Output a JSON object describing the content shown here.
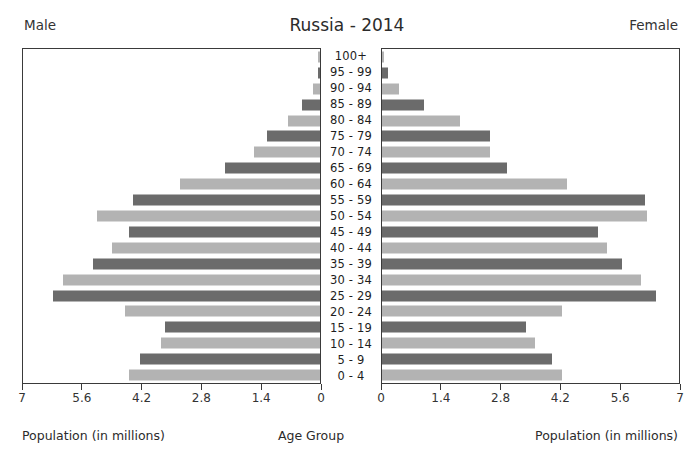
{
  "header": {
    "title": "Russia - 2014",
    "male_label": "Male",
    "female_label": "Female"
  },
  "footer": {
    "left_caption": "Population (in millions)",
    "center_caption": "Age Group",
    "right_caption": "Population (in millions)"
  },
  "axis": {
    "male_ticks": [
      "7",
      "5.6",
      "4.2",
      "2.8",
      "1.4",
      "0"
    ],
    "female_ticks": [
      "0",
      "1.4",
      "2.8",
      "4.2",
      "5.6",
      "7"
    ],
    "max": 7,
    "tick_step": 1.4
  },
  "style": {
    "bar_dark": "#6b6b6b",
    "bar_light": "#b3b3b3",
    "frame": "#3a3a3a",
    "background": "#ffffff",
    "text": "#2b2b2b"
  },
  "chart_data": {
    "type": "bar",
    "title": "Russia - 2014",
    "subtitle": "",
    "xlabel": "Population (in millions)",
    "ylabel": "Age Group",
    "xlim": [
      0,
      7
    ],
    "grid": false,
    "legend": [
      "Male",
      "Female"
    ],
    "legend_position": "top-left and top-right",
    "categories": [
      "100+",
      "95 - 99",
      "90 - 94",
      "85 - 89",
      "80 - 84",
      "75 - 79",
      "70 - 74",
      "65 - 69",
      "60 - 64",
      "55 - 59",
      "50 - 54",
      "45 - 49",
      "40 - 44",
      "35 - 39",
      "30 - 34",
      "25 - 29",
      "20 - 24",
      "15 - 19",
      "10 - 14",
      "5 - 9",
      "0 - 4"
    ],
    "series": [
      {
        "name": "Male",
        "side": "left",
        "values": [
          0.01,
          0.05,
          0.16,
          0.42,
          0.75,
          1.25,
          1.55,
          2.25,
          3.3,
          4.4,
          5.25,
          4.5,
          4.9,
          5.35,
          6.05,
          6.3,
          4.6,
          3.65,
          3.75,
          4.25,
          4.5
        ]
      },
      {
        "name": "Female",
        "side": "right",
        "values": [
          0.02,
          0.13,
          0.4,
          1.0,
          1.85,
          2.55,
          2.55,
          2.95,
          4.35,
          6.2,
          6.25,
          5.1,
          5.3,
          5.65,
          6.1,
          6.45,
          4.25,
          3.4,
          3.6,
          4.0,
          4.25
        ]
      }
    ],
    "bar_shades": [
      "light",
      "dark",
      "light",
      "dark",
      "light",
      "dark",
      "light",
      "dark",
      "light",
      "dark",
      "light",
      "dark",
      "light",
      "dark",
      "light",
      "dark",
      "light",
      "dark",
      "light",
      "dark",
      "light"
    ]
  }
}
